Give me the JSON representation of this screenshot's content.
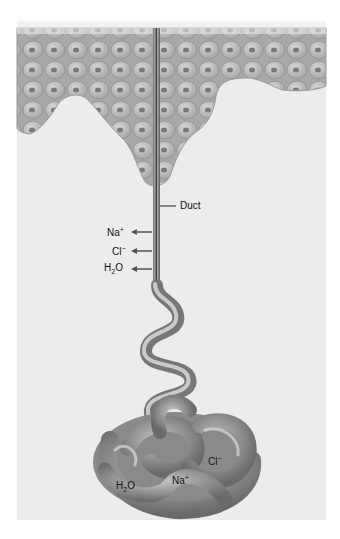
{
  "diagram": {
    "labels": {
      "duct": "Duct",
      "duct_na": "Na",
      "duct_na_charge": "+",
      "duct_cl": "Cl",
      "duct_cl_charge": "−",
      "duct_h2o_h": "H",
      "duct_h2o_sub": "2",
      "duct_h2o_o": "O",
      "coil_cl": "Cl",
      "coil_cl_charge": "−",
      "coil_na": "Na",
      "coil_na_charge": "+",
      "coil_h2o_h": "H",
      "coil_h2o_sub": "2",
      "coil_h2o_o": "O"
    },
    "regions": [
      "epidermis-cell-layer",
      "duct",
      "coiled-secretory-portion"
    ],
    "arrows": [
      {
        "ion": "Na+",
        "direction": "left"
      },
      {
        "ion": "Cl-",
        "direction": "left"
      },
      {
        "ion": "H2O",
        "direction": "left"
      }
    ],
    "colors": {
      "background": "#ececec",
      "cells": "#b8b8b8",
      "cell_nucleus": "#7a7a7a",
      "tube": "#8c8c8c",
      "label_text": "#111111"
    }
  }
}
